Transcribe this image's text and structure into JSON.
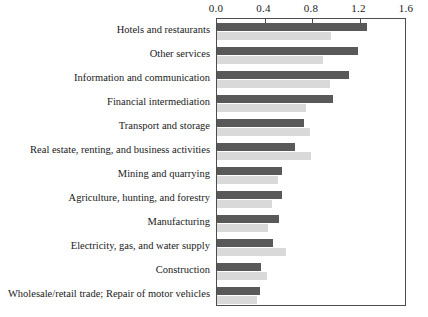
{
  "chart_data": {
    "type": "bar",
    "orientation": "horizontal",
    "title": "",
    "xlabel": "",
    "ylabel": "",
    "xlim": [
      0.0,
      1.6
    ],
    "grid": false,
    "legend": "none",
    "xticks": [
      "0.0",
      "0.4",
      "0.8",
      "1.2",
      "1.6"
    ],
    "xtick_values": [
      0.0,
      0.4,
      0.8,
      1.2,
      1.6
    ],
    "categories": [
      "Hotels and restaurants",
      "Other services",
      "Information and communication",
      "Financial intermediation",
      "Transport and storage",
      "Real estate, renting, and business activities",
      "Mining and quarrying",
      "Agriculture, hunting, and forestry",
      "Manufacturing",
      "Electricity, gas, and water supply",
      "Construction",
      "Wholesale/retail trade; Repair of motor vehicles"
    ],
    "series": [
      {
        "name": "series-dark",
        "color": "#595959",
        "values": [
          1.26,
          1.19,
          1.11,
          0.98,
          0.73,
          0.66,
          0.55,
          0.55,
          0.52,
          0.47,
          0.37,
          0.36
        ]
      },
      {
        "name": "series-light",
        "color": "#d9d9d9",
        "values": [
          0.96,
          0.89,
          0.95,
          0.75,
          0.78,
          0.79,
          0.51,
          0.46,
          0.43,
          0.58,
          0.42,
          0.34
        ]
      }
    ]
  },
  "colors": {
    "dark_bar": "#595959",
    "light_bar": "#d9d9d9",
    "axis": "#4d4d4d",
    "text": "#1a1a1a",
    "background": "#ffffff"
  }
}
